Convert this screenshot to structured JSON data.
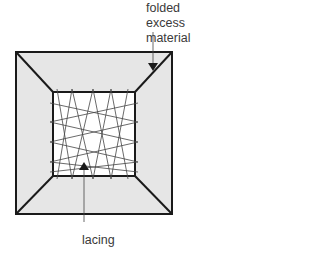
{
  "diagram": {
    "labels": {
      "top_label_line1": "folded excess",
      "top_label_line2": "material",
      "bottom_label": "lacing"
    },
    "colors": {
      "outer_fill": "#e6e6e6",
      "inner_fill": "#ffffff",
      "stroke": "#1a1a1a",
      "lacing": "#444444",
      "text": "#3a3a3a"
    },
    "shapes": {
      "outer_square": {
        "x": 16,
        "y": 52,
        "w": 156,
        "h": 162
      },
      "inner_square": {
        "x": 53,
        "y": 92,
        "w": 82,
        "h": 84
      }
    }
  }
}
